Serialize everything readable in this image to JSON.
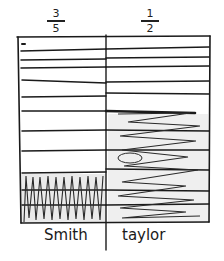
{
  "columns": [
    {
      "name": "Smith",
      "fraction": {
        "numerator": "3",
        "denominator": "5"
      },
      "fill_style": "vertical-zigzag",
      "shaded_from_top_fraction": 0.73
    },
    {
      "name": "taylor",
      "fraction": {
        "numerator": "1",
        "denominator": "2"
      },
      "fill_style": "horizontal-scribble",
      "shaded_from_top_fraction": 0.45
    }
  ],
  "colors": {
    "ink": "#1a1a1a",
    "paper": "#ffffff",
    "shade": "#d8d8d8"
  }
}
